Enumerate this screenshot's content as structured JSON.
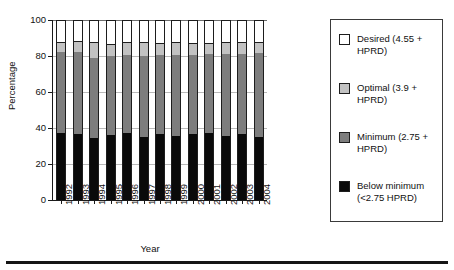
{
  "chart_data": {
    "type": "bar",
    "subtype": "stacked-100-percent",
    "title": "",
    "xlabel": "Year",
    "ylabel": "Percentage",
    "ylim": [
      0,
      100
    ],
    "yticks": [
      0,
      20,
      40,
      60,
      80,
      100
    ],
    "grid": true,
    "legend_position": "right",
    "categories": [
      "1992",
      "1993",
      "1994",
      "1995",
      "1996",
      "1997",
      "1998",
      "1999",
      "2000",
      "2001",
      "2002",
      "2003",
      "2004"
    ],
    "series": [
      {
        "name": "Below minimum (<2.75 HPRD)",
        "color": "#0a0a0a",
        "values": [
          37.5,
          36.5,
          34.5,
          36.0,
          37.0,
          35.0,
          36.5,
          35.5,
          36.5,
          37.5,
          35.5,
          36.5,
          35.0
        ]
      },
      {
        "name": "Minimum (2.75 + HPRD)",
        "color": "#7d7d7d",
        "values": [
          44.5,
          45.5,
          44.5,
          44.0,
          43.5,
          45.0,
          44.0,
          45.0,
          44.0,
          43.5,
          45.5,
          44.5,
          46.5
        ]
      },
      {
        "name": "Optimal (3.9 + HPRD)",
        "color": "#c2c2c2",
        "values": [
          5.5,
          6.0,
          8.0,
          6.0,
          6.5,
          7.0,
          6.0,
          6.5,
          6.0,
          5.5,
          6.0,
          6.5,
          6.0
        ]
      },
      {
        "name": "Desired (4.55 + HPRD)",
        "color": "#ffffff",
        "values": [
          12.5,
          12.0,
          13.0,
          14.0,
          13.0,
          13.0,
          13.5,
          13.0,
          13.5,
          13.5,
          13.0,
          12.5,
          12.5
        ]
      }
    ]
  },
  "axes": {
    "y_title": "Percentage",
    "x_title": "Year",
    "y_tick_labels": [
      "0",
      "20",
      "40",
      "60",
      "80",
      "100"
    ],
    "x_tick_labels": [
      "1992",
      "1993",
      "1994",
      "1995",
      "1996",
      "1997",
      "1998",
      "1999",
      "2000",
      "2001",
      "2002",
      "2003",
      "2004"
    ]
  },
  "legend": {
    "items": [
      {
        "label": "Desired (4.55 + HPRD)",
        "swatch": "white-square",
        "color": "#ffffff"
      },
      {
        "label": "Optimal (3.9 + HPRD)",
        "swatch": "light-gray-square",
        "color": "#c2c2c2"
      },
      {
        "label": "Minimum (2.75 + HPRD)",
        "swatch": "medium-gray-square",
        "color": "#7d7d7d"
      },
      {
        "label": "Below minimum (<2.75 HPRD)",
        "swatch": "black-square",
        "color": "#0a0a0a"
      }
    ]
  }
}
